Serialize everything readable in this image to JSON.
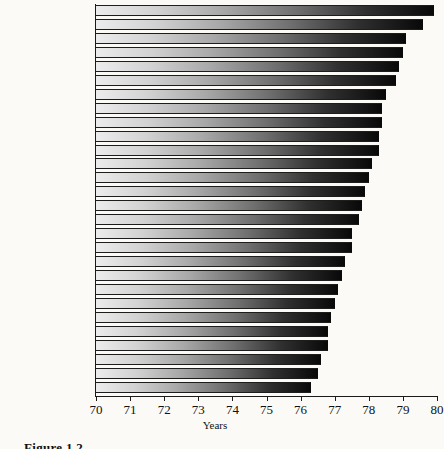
{
  "caption": "Figure 1.2",
  "chart_data": {
    "type": "bar",
    "orientation": "horizontal",
    "title": "",
    "xlabel": "Years",
    "ylabel": "",
    "xlim": [
      70,
      80
    ],
    "xticks": [
      70,
      71,
      72,
      73,
      74,
      75,
      76,
      77,
      78,
      79,
      80
    ],
    "grid": false,
    "legend": false,
    "bar_style": "grayscale-gradient-light-to-dark",
    "categories": [
      "Japan",
      "Australia",
      "Canada",
      "Sweden",
      "Switzerland",
      "Iceland",
      "France",
      "Singapore",
      "Israel",
      "Italy",
      "Monaco",
      "Greece",
      "Norway",
      "Netherlands",
      "Spain",
      "New Zealand",
      "Austria",
      "Belgium",
      "Finland",
      "United Kingdom",
      "Germany",
      "Cyprus",
      "Kuwait",
      "Taiwan",
      "Denmark",
      "Ireland",
      "Montenegro",
      "United States"
    ],
    "values": [
      79.9,
      79.6,
      79.1,
      79.0,
      78.9,
      78.8,
      78.5,
      78.4,
      78.4,
      78.3,
      78.3,
      78.1,
      78.0,
      77.9,
      77.8,
      77.7,
      77.5,
      77.5,
      77.3,
      77.2,
      77.1,
      77.0,
      76.9,
      76.8,
      76.8,
      76.6,
      76.5,
      76.3
    ]
  }
}
